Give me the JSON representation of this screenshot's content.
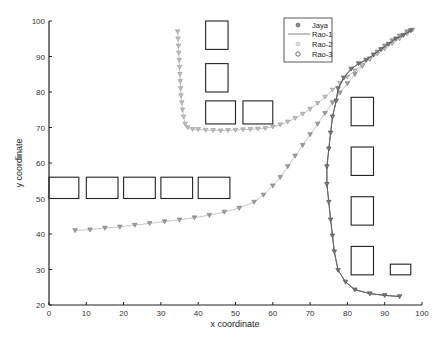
{
  "chart_data": {
    "type": "line",
    "title": "",
    "xlabel": "x coordinate",
    "ylabel": "y coordinate",
    "xlim": [
      0,
      100
    ],
    "ylim": [
      20,
      100
    ],
    "xticks": [
      0,
      10,
      20,
      30,
      40,
      50,
      60,
      70,
      80,
      90,
      100
    ],
    "yticks": [
      20,
      30,
      40,
      50,
      60,
      70,
      80,
      90,
      100
    ],
    "grid": false,
    "legend_position": "upper-right-inside",
    "legend": [
      "Jaya",
      "Rao-1",
      "Rao-2",
      "Rao-3"
    ],
    "obstacles": [
      {
        "x": 0,
        "y": 50,
        "w": 8,
        "h": 6
      },
      {
        "x": 10,
        "y": 50,
        "w": 8.5,
        "h": 6
      },
      {
        "x": 20,
        "y": 50,
        "w": 8.5,
        "h": 6
      },
      {
        "x": 30,
        "y": 50,
        "w": 8.5,
        "h": 6
      },
      {
        "x": 40,
        "y": 50,
        "w": 8.5,
        "h": 6
      },
      {
        "x": 42,
        "y": 92,
        "w": 6,
        "h": 8
      },
      {
        "x": 42,
        "y": 80,
        "w": 6,
        "h": 8
      },
      {
        "x": 42,
        "y": 71,
        "w": 8,
        "h": 6.5
      },
      {
        "x": 52,
        "y": 71,
        "w": 8,
        "h": 6.5
      },
      {
        "x": 81,
        "y": 70.5,
        "w": 6,
        "h": 8
      },
      {
        "x": 81,
        "y": 56.5,
        "w": 6,
        "h": 8
      },
      {
        "x": 81,
        "y": 42.5,
        "w": 6,
        "h": 8
      },
      {
        "x": 81,
        "y": 28.5,
        "w": 6,
        "h": 8
      },
      {
        "x": 91.5,
        "y": 28.5,
        "w": 5.5,
        "h": 3
      }
    ],
    "series": [
      {
        "name": "Jaya",
        "style": "dark-marker-line",
        "color": "#555555",
        "points": [
          [
            94,
            22.4
          ],
          [
            90,
            22.7
          ],
          [
            86,
            23.2
          ],
          [
            82,
            24.3
          ],
          [
            79.5,
            26.5
          ],
          [
            77.5,
            29.8
          ],
          [
            76.5,
            35
          ],
          [
            76,
            39.5
          ],
          [
            75.5,
            44
          ],
          [
            75,
            49
          ],
          [
            74.5,
            54
          ],
          [
            74.5,
            59
          ],
          [
            75,
            64
          ],
          [
            75.5,
            68.5
          ],
          [
            76,
            73
          ],
          [
            77,
            77.5
          ],
          [
            77.5,
            81
          ],
          [
            79,
            84
          ],
          [
            81,
            86.5
          ],
          [
            83,
            88
          ],
          [
            85,
            89
          ],
          [
            87,
            90.5
          ],
          [
            89,
            92
          ],
          [
            91,
            93.5
          ],
          [
            93,
            95
          ],
          [
            95,
            96
          ],
          [
            97,
            97.3
          ]
        ]
      },
      {
        "name": "Rao-1",
        "style": "line",
        "color": "#666666",
        "points": [
          [
            94,
            22.4
          ],
          [
            90,
            22.7
          ],
          [
            86,
            23.2
          ],
          [
            82,
            24.3
          ],
          [
            79.5,
            26.5
          ],
          [
            77.5,
            29.8
          ],
          [
            76.5,
            35
          ],
          [
            76,
            39.5
          ],
          [
            75.5,
            44
          ],
          [
            75,
            49
          ],
          [
            74.5,
            54
          ],
          [
            74.5,
            59
          ],
          [
            75,
            64
          ],
          [
            75.5,
            68.5
          ],
          [
            76,
            73
          ],
          [
            77,
            77.5
          ],
          [
            77.5,
            81
          ],
          [
            79,
            84
          ],
          [
            81,
            86.5
          ],
          [
            83,
            88
          ],
          [
            85,
            89
          ],
          [
            87,
            90.5
          ],
          [
            89,
            92
          ],
          [
            91,
            93.5
          ],
          [
            93,
            95
          ],
          [
            95,
            96
          ],
          [
            97,
            97.3
          ]
        ]
      },
      {
        "name": "Rao-2",
        "style": "light-marker-line",
        "color": "#aaaaaa",
        "points": [
          [
            34.5,
            97
          ],
          [
            34.6,
            95
          ],
          [
            34.7,
            93
          ],
          [
            34.8,
            91
          ],
          [
            34.9,
            89
          ],
          [
            35,
            87
          ],
          [
            35.1,
            85
          ],
          [
            35.2,
            83
          ],
          [
            35.3,
            81
          ],
          [
            35.4,
            79
          ],
          [
            35.6,
            77
          ],
          [
            35.8,
            75
          ],
          [
            36.1,
            73
          ],
          [
            36.5,
            71
          ],
          [
            37.2,
            70
          ],
          [
            38.5,
            69.5
          ],
          [
            40,
            69.5
          ],
          [
            42,
            69.3
          ],
          [
            44,
            69.2
          ],
          [
            46,
            69.1
          ],
          [
            48,
            69.2
          ],
          [
            50,
            69.3
          ],
          [
            52,
            69.4
          ],
          [
            54,
            69.5
          ],
          [
            56,
            69.6
          ],
          [
            58,
            69.8
          ],
          [
            60,
            70.2
          ],
          [
            62,
            70.8
          ],
          [
            64,
            71.6
          ],
          [
            66,
            72.6
          ],
          [
            68,
            73.8
          ],
          [
            70,
            75.2
          ],
          [
            72,
            76.8
          ],
          [
            74,
            78.6
          ],
          [
            76,
            80.6
          ],
          [
            78,
            82.5
          ],
          [
            80,
            84.3
          ],
          [
            82,
            86
          ],
          [
            84,
            87.6
          ],
          [
            86,
            89.2
          ],
          [
            88,
            90.7
          ],
          [
            90,
            92.2
          ],
          [
            92,
            93.6
          ],
          [
            94,
            95
          ],
          [
            96,
            96.4
          ],
          [
            97.5,
            97.5
          ]
        ]
      },
      {
        "name": "Rao-3",
        "style": "light-marker-line",
        "color": "#888888",
        "points": [
          [
            7,
            41
          ],
          [
            11,
            41.2
          ],
          [
            15,
            41.7
          ],
          [
            19,
            42
          ],
          [
            23,
            42.5
          ],
          [
            27,
            43
          ],
          [
            31,
            43.5
          ],
          [
            35,
            44
          ],
          [
            39,
            44.6
          ],
          [
            43,
            45.3
          ],
          [
            47,
            46.2
          ],
          [
            51,
            47.3
          ],
          [
            55,
            49
          ],
          [
            57.5,
            51
          ],
          [
            60,
            53.6
          ],
          [
            62,
            56
          ],
          [
            64,
            59
          ],
          [
            66,
            62
          ],
          [
            68,
            65
          ],
          [
            70,
            68
          ],
          [
            72,
            71
          ],
          [
            74,
            74
          ],
          [
            76,
            77
          ],
          [
            78,
            79.8
          ],
          [
            80,
            82.4
          ],
          [
            82,
            85
          ],
          [
            84,
            87.3
          ],
          [
            86,
            89.4
          ],
          [
            88,
            91.3
          ],
          [
            90,
            93
          ],
          [
            92,
            94.5
          ],
          [
            94,
            95.8
          ],
          [
            96,
            97
          ]
        ]
      }
    ]
  }
}
